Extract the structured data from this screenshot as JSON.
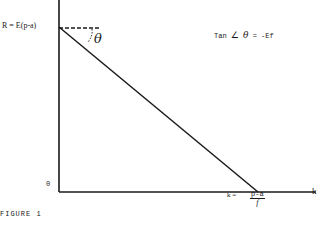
{
  "diagram": {
    "labels": {
      "r_intercept": "R = E(p-a)",
      "theta": "θ",
      "tan_eq_prefix": "Tan",
      "angle_symbol": "∠",
      "tan_eq_theta": "θ",
      "tan_eq_suffix": "= -Ef",
      "origin": "0",
      "k_intercept_prefix": "k =",
      "k_numerator": "p-a",
      "k_denominator": "f",
      "x_axis": "k",
      "caption": "FIGURE 1"
    },
    "colors": {
      "ink": "#1a1a1a",
      "background": "#ffffff"
    },
    "geometry": {
      "y_axis_x": 59,
      "x_axis_y": 192,
      "r_point_y": 27,
      "k_point_x": 258,
      "x_axis_end": 316
    }
  }
}
